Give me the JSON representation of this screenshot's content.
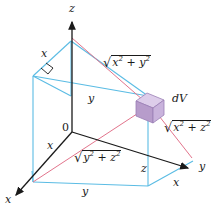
{
  "figure": {
    "colors": {
      "axis": "#1a1a1a",
      "box_edge": "#5bbce4",
      "radial_line": "#e2748c",
      "dv_front": "#b79ccb",
      "dv_top": "#d9c8e6",
      "dv_side": "#c7b0da",
      "background": "#ffffff"
    }
  },
  "axes": {
    "z_label": "z",
    "y_label": "y",
    "x_label": "x",
    "origin_label": "0"
  },
  "labels": {
    "edge_x_top": "x",
    "edge_y_mid": "y",
    "edge_x_left": "x",
    "edge_x_front": "x",
    "edge_y_bottom": "y",
    "edge_z_right": "z",
    "edge_x_right": "x",
    "axis_y_right": "y",
    "axis_x_lower": "x"
  },
  "distances": [
    {
      "id": "dist-xy",
      "sqrt": "√",
      "var1": "x",
      "var2": "y",
      "exp": "2",
      "plain": "sqrt(x^2 + y^2)"
    },
    {
      "id": "dist-xz",
      "sqrt": "√",
      "var1": "x",
      "var2": "z",
      "exp": "2",
      "plain": "sqrt(x^2 + z^2)"
    },
    {
      "id": "dist-yz",
      "sqrt": "√",
      "var1": "y",
      "var2": "z",
      "exp": "2",
      "plain": "sqrt(y^2 + z^2)"
    }
  ],
  "volume_element": {
    "label_d": "d",
    "label_v": "V",
    "full": "dV"
  }
}
